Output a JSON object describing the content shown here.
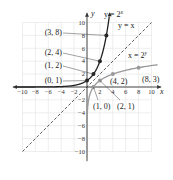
{
  "chart_data": {
    "type": "line",
    "title": "",
    "xlabel": "x",
    "ylabel": "y",
    "xlim": [
      -10,
      10
    ],
    "ylim": [
      -10,
      10
    ],
    "grid": true,
    "x_ticks": [
      "-10",
      "-8",
      "-6",
      "-4",
      "-2",
      "2",
      "4",
      "6",
      "8",
      "10"
    ],
    "y_ticks": [
      "10",
      "8",
      "6",
      "4",
      "2",
      "-2",
      "-4",
      "-6",
      "-8",
      "-10"
    ],
    "series": [
      {
        "name": "y = 2^x",
        "label": "y = 2",
        "label_sup": "x",
        "color": "#222222",
        "style": "solid",
        "points": [
          [
            0,
            1
          ],
          [
            1,
            2
          ],
          [
            2,
            4
          ],
          [
            3,
            8
          ]
        ],
        "point_labels": [
          "(0, 1)",
          "(1, 2)",
          "(2, 4)",
          "(3, 8)"
        ]
      },
      {
        "name": "y = x",
        "label": "y = x",
        "color": "#333333",
        "style": "dashed"
      },
      {
        "name": "x = 2^y",
        "label": "x = 2",
        "label_sup": "y",
        "color": "#999999",
        "style": "solid",
        "points": [
          [
            1,
            0
          ],
          [
            2,
            1
          ],
          [
            4,
            2
          ],
          [
            8,
            3
          ]
        ],
        "point_labels": [
          "(1, 0)",
          "(2, 1)",
          "(4, 2)",
          "(8, 3)"
        ]
      }
    ]
  }
}
